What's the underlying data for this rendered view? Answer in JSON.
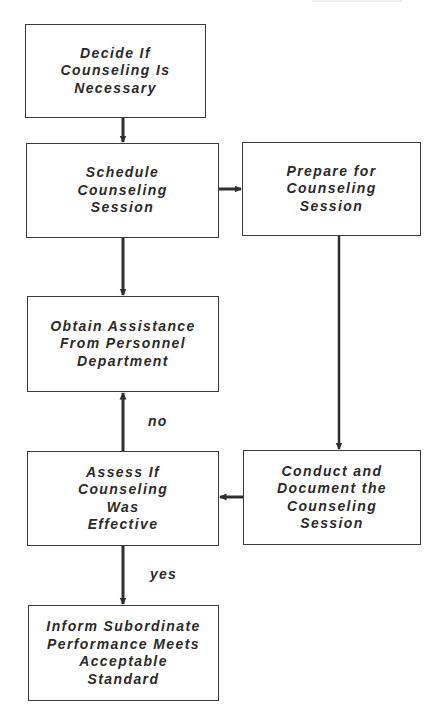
{
  "diagram": {
    "type": "flowchart",
    "colors": {
      "line": "#2e2e2e",
      "border": "#3a3a3a",
      "text": "#2a2a2a",
      "background": "#ffffff"
    },
    "nodes": [
      {
        "id": "decide",
        "label": "Decide If\nCounseling Is\nNecessary"
      },
      {
        "id": "schedule",
        "label": "Schedule\nCounseling\nSession"
      },
      {
        "id": "prepare",
        "label": "Prepare for\nCounseling\nSession"
      },
      {
        "id": "obtain",
        "label": "Obtain Assistance\nFrom Personnel\nDepartment"
      },
      {
        "id": "assess",
        "label": "Assess If\nCounseling\nWas\nEffective"
      },
      {
        "id": "conduct",
        "label": "Conduct and\nDocument the\nCounseling\nSession"
      },
      {
        "id": "inform",
        "label": "Inform Subordinate\nPerformance Meets\nAcceptable\nStandard"
      }
    ],
    "edges": [
      {
        "from": "decide",
        "to": "schedule",
        "label": ""
      },
      {
        "from": "schedule",
        "to": "prepare",
        "label": ""
      },
      {
        "from": "schedule",
        "to": "obtain",
        "label": ""
      },
      {
        "from": "prepare",
        "to": "conduct",
        "label": ""
      },
      {
        "from": "conduct",
        "to": "assess",
        "label": ""
      },
      {
        "from": "assess",
        "to": "obtain",
        "label": "no"
      },
      {
        "from": "assess",
        "to": "inform",
        "label": "yes"
      }
    ],
    "edge_labels": {
      "no": "no",
      "yes": "yes"
    }
  }
}
